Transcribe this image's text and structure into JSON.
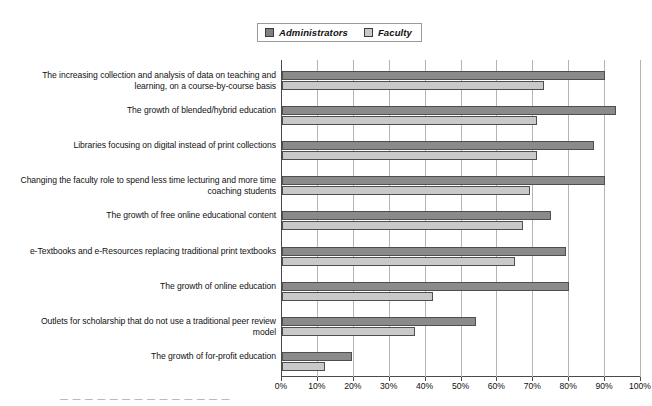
{
  "chart_data": {
    "type": "bar",
    "orientation": "horizontal",
    "title": "",
    "xlabel": "",
    "ylabel": "",
    "xlim": [
      0,
      100
    ],
    "xticks": [
      "0%",
      "10%",
      "20%",
      "30%",
      "40%",
      "50%",
      "60%",
      "70%",
      "80%",
      "90%",
      "100%"
    ],
    "grid": true,
    "legend_position": "top-center",
    "categories": [
      "The increasing collection and analysis of data on teaching and learning, on a course-by-course basis",
      "The growth of blended/hybrid education",
      "Libraries focusing on digital instead of print collections",
      "Changing the faculty role to spend less time lecturing and more time coaching students",
      "The growth of free online educational content",
      "e-Textbooks and e-Resources replacing traditional print textbooks",
      "The growth of online education",
      "Outlets for scholarship that do not use a traditional peer review model",
      "The growth of for-profit education"
    ],
    "series": [
      {
        "name": "Administrators",
        "color": "#8a8a8a",
        "values": [
          90,
          93,
          87,
          90,
          75,
          79,
          80,
          54,
          19.5
        ]
      },
      {
        "name": "Faculty",
        "color": "#c9c9c9",
        "values": [
          73,
          71,
          71,
          69,
          67,
          65,
          42,
          37,
          12
        ]
      }
    ]
  },
  "legend": {
    "entries": [
      {
        "label": "Administrators",
        "swatch": "admin"
      },
      {
        "label": "Faculty",
        "swatch": "faculty"
      }
    ]
  },
  "footer": {
    "caption_sliver": "— — — — — — — — — — — — — —"
  }
}
